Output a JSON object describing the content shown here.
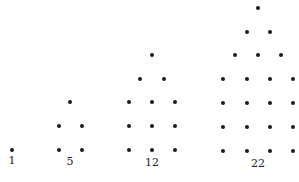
{
  "diagram": {
    "type": "pentagonal-number-dot-patterns",
    "dot_color": "#1a1a1a",
    "figures": [
      {
        "label": "1",
        "label_pos": [
          12,
          155
        ],
        "dots": [
          [
            12,
            150
          ]
        ]
      },
      {
        "label": "5",
        "label_pos": [
          70,
          156
        ],
        "dots": [
          [
            70,
            102
          ],
          [
            59,
            126
          ],
          [
            82,
            126
          ],
          [
            59,
            150
          ],
          [
            82,
            150
          ]
        ]
      },
      {
        "label": "12",
        "label_pos": [
          152,
          157
        ],
        "dots": [
          [
            152,
            55
          ],
          [
            140,
            79
          ],
          [
            164,
            79
          ],
          [
            129,
            102
          ],
          [
            152,
            102
          ],
          [
            175,
            102
          ],
          [
            129,
            126
          ],
          [
            152,
            126
          ],
          [
            175,
            126
          ],
          [
            129,
            150
          ],
          [
            152,
            150
          ],
          [
            175,
            150
          ]
        ]
      },
      {
        "label": "22",
        "label_pos": [
          258,
          158
        ],
        "dots": [
          [
            258,
            8
          ],
          [
            247,
            32
          ],
          [
            270,
            32
          ],
          [
            235,
            55
          ],
          [
            258,
            55
          ],
          [
            281,
            55
          ],
          [
            223,
            79
          ],
          [
            247,
            79
          ],
          [
            270,
            79
          ],
          [
            293,
            79
          ],
          [
            223,
            103
          ],
          [
            247,
            103
          ],
          [
            270,
            103
          ],
          [
            293,
            103
          ],
          [
            223,
            127
          ],
          [
            247,
            127
          ],
          [
            270,
            127
          ],
          [
            293,
            127
          ],
          [
            223,
            151
          ],
          [
            247,
            151
          ],
          [
            270,
            151
          ],
          [
            293,
            151
          ]
        ]
      }
    ]
  }
}
